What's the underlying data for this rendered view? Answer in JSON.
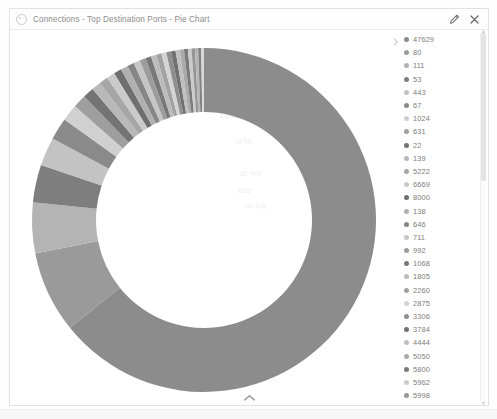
{
  "window": {
    "title": "Connections - Top Destination Ports - Pie Chart",
    "gear_icon": "gear-icon",
    "edit_icon": "pencil-icon",
    "close_icon": "close-icon",
    "collapse_icon": "chevron-up-icon",
    "legend_toggle_icon": "chevron-right-icon"
  },
  "watermark": {
    "line1": "uge",
    "line2": "gam",
    "line3": "rules",
    "line4": "win",
    "line5": "at we",
    "line6": "nse",
    "line7": "racing"
  },
  "legend": {
    "scroll_up_icon": "caret-up-icon",
    "scroll_down_icon": "caret-down-icon"
  },
  "chart_data": {
    "type": "pie",
    "title": "Connections - Top Destination Ports - Pie Chart",
    "subtype": "donut",
    "legend_position": "right",
    "categories": [
      "47629",
      "80",
      "111",
      "53",
      "443",
      "67",
      "1024",
      "631",
      "22",
      "139",
      "5222",
      "6669",
      "8000",
      "138",
      "646",
      "711",
      "992",
      "1068",
      "1805",
      "2260",
      "2875",
      "3306",
      "3784",
      "4444",
      "5050",
      "5800",
      "5962",
      "5998",
      "7002",
      "9535",
      "16992"
    ],
    "values": [
      62.0,
      7.4,
      4.6,
      3.4,
      2.6,
      2.0,
      1.5,
      1.2,
      1.0,
      0.85,
      0.8,
      0.75,
      0.7,
      0.66,
      0.62,
      0.58,
      0.55,
      0.52,
      0.49,
      0.47,
      0.45,
      0.43,
      0.41,
      0.39,
      0.37,
      0.35,
      0.33,
      0.31,
      0.29,
      0.27,
      0.25
    ],
    "colors": [
      "#8c8c8c",
      "#9a9a9a",
      "#b4b4b4",
      "#7e7e7e",
      "#c3c3c3",
      "#8a8a8a",
      "#d0d0d0",
      "#9e9e9e",
      "#747474",
      "#b9b9b9",
      "#a6a6a6",
      "#cacaca",
      "#6f6f6f",
      "#b0b0b0",
      "#868686",
      "#c6c6c6",
      "#9c9c9c",
      "#787878",
      "#bcbcbc",
      "#a2a2a2",
      "#d4d4d4",
      "#8e8e8e",
      "#707070",
      "#c0c0c0",
      "#aaaaaa",
      "#7a7a7a",
      "#cccccc",
      "#969696",
      "#b6b6b6",
      "#828282",
      "#d8d8d8"
    ],
    "ylabel": "",
    "xlabel": ""
  }
}
